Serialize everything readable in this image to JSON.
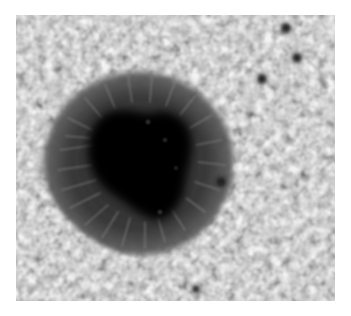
{
  "image": {
    "subject": "Sunspot on solar photosphere with surrounding granulation",
    "colors": {
      "background": "#ffffff",
      "photosphere": "#a9a9a9",
      "granule_bright": "#c4c4c4",
      "intergranular_lane": "#7c7c7c",
      "penumbra": "#3a3a3a",
      "penumbra_filament_bright": "#7a7a7a",
      "umbra": "#050505"
    },
    "sunspot": {
      "center": [
        135,
        160
      ],
      "penumbra_radius": [
        100,
        94
      ],
      "umbra_extent": {
        "x": [
          85,
          195
        ],
        "y": [
          110,
          222
        ]
      }
    },
    "pores": [
      {
        "cx": 286,
        "cy": 28,
        "r": 5
      },
      {
        "cx": 297,
        "cy": 58,
        "r": 5
      },
      {
        "cx": 262,
        "cy": 79,
        "r": 5
      },
      {
        "cx": 196,
        "cy": 289,
        "r": 4
      },
      {
        "cx": 221,
        "cy": 182,
        "r": 5
      }
    ]
  }
}
